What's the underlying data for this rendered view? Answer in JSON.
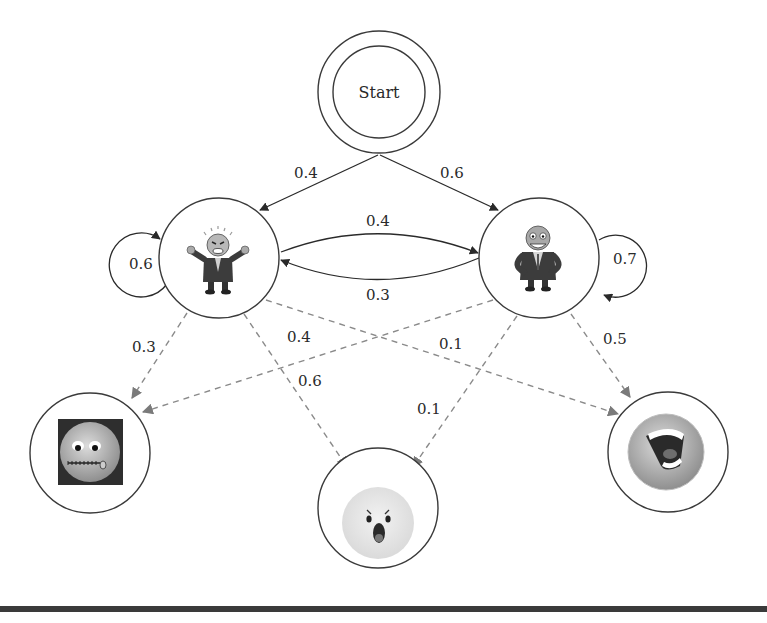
{
  "diagram": {
    "type": "hidden-markov-model",
    "colors": {
      "solid_edge": "#2a2a2a",
      "dashed_edge": "#8a8a8a",
      "node_stroke": "#3a3a3a",
      "bottom_bar": "#3a3a3a"
    },
    "start": {
      "label": "Start"
    },
    "hidden_states": [
      {
        "id": "angry-boss",
        "icon": "angry-businessman-icon",
        "self_loop": "0.6"
      },
      {
        "id": "happy-boss",
        "icon": "happy-businessman-icon",
        "self_loop": "0.7"
      }
    ],
    "observations": [
      {
        "id": "silent",
        "icon": "zipped-mouth-face-icon"
      },
      {
        "id": "shocked",
        "icon": "shocked-face-icon"
      },
      {
        "id": "laughing",
        "icon": "laughing-face-icon"
      }
    ],
    "edges": {
      "start_to_angry": "0.4",
      "start_to_happy": "0.6",
      "angry_to_happy": "0.4",
      "happy_to_angry": "0.3",
      "angry_to_silent": "0.3",
      "angry_to_shocked": "0.6",
      "angry_to_laughing": "0.1",
      "happy_to_silent": "0.4",
      "happy_to_shocked": "0.1",
      "happy_to_laughing": "0.5"
    }
  }
}
